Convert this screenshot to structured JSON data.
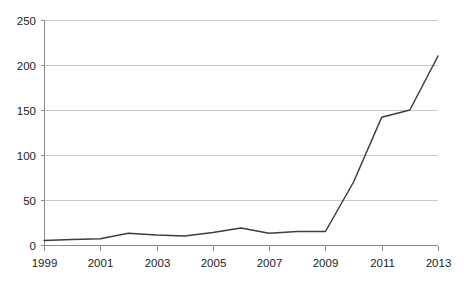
{
  "chart_data": {
    "type": "line",
    "title": "",
    "subtitle": "",
    "xlabel": "",
    "ylabel": "",
    "xlim": [
      1999,
      2013
    ],
    "ylim": [
      0,
      250
    ],
    "grid": true,
    "legend": null,
    "y_ticks": [
      0,
      50,
      100,
      150,
      200,
      250
    ],
    "y_tick_labels": [
      "0",
      "50",
      "100",
      "150",
      "200",
      "250"
    ],
    "x_ticks": [
      1999,
      2001,
      2003,
      2005,
      2007,
      2009,
      2011,
      2013
    ],
    "x_tick_labels": [
      "1999",
      "2001",
      "2003",
      "2005",
      "2007",
      "2009",
      "2011",
      "2013"
    ],
    "x": [
      1999,
      2000,
      2001,
      2002,
      2003,
      2004,
      2005,
      2006,
      2007,
      2008,
      2009,
      2010,
      2011,
      2012,
      2013
    ],
    "values": [
      5,
      6,
      7,
      13,
      11,
      10,
      14,
      19,
      13,
      15,
      15,
      70,
      142,
      150,
      210
    ],
    "series": [
      {
        "name": "series-1",
        "color": "#3d3d3d",
        "values": [
          5,
          6,
          7,
          13,
          11,
          10,
          14,
          19,
          13,
          15,
          15,
          70,
          142,
          150,
          210
        ]
      }
    ],
    "colors": {
      "line": "#3d3d3d",
      "grid": "#c9c9c9",
      "axis": "#8a8a8a",
      "text": "#1c1c1c",
      "background": "#ffffff"
    },
    "plot_area": {
      "left": 44,
      "right": 438,
      "top": 20,
      "bottom": 245
    }
  }
}
